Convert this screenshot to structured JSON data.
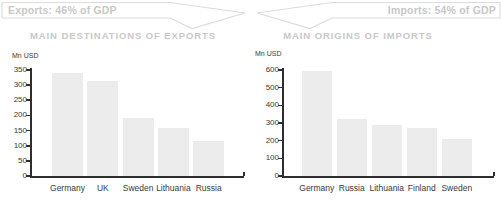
{
  "banners": {
    "exports": {
      "label": "Exports: 46% of GDP",
      "direction": "right"
    },
    "imports": {
      "label": "Imports: 54% of GDP",
      "direction": "left"
    }
  },
  "colors": {
    "bar_fill": "#ececec",
    "axis": "#2e2e2e",
    "muted_gray": "#c8c8c8",
    "banner_border": "#dcdcdc",
    "tick_label": "#3a3a3a"
  },
  "chart_data": [
    {
      "type": "bar",
      "title": "MAIN DESTINATIONS OF EXPORTS",
      "unit_label": "Mn USD",
      "categories": [
        "Germany",
        "UK",
        "Sweden",
        "Lithuania",
        "Russia"
      ],
      "values": [
        340,
        315,
        190,
        160,
        115
      ],
      "xlabel": "",
      "ylabel": "Mn USD",
      "ylim": [
        0,
        350
      ],
      "ytick_step": 50,
      "grid": false,
      "legend": false
    },
    {
      "type": "bar",
      "title": "MAIN ORIGINS OF IMPORTS",
      "unit_label": "Mn USD",
      "categories": [
        "Germany",
        "Russia",
        "Lithuania",
        "Finland",
        "Sweden"
      ],
      "values": [
        595,
        320,
        290,
        270,
        210
      ],
      "xlabel": "",
      "ylabel": "Mn USD",
      "ylim": [
        0,
        600
      ],
      "ytick_step": 100,
      "grid": false,
      "legend": false
    }
  ]
}
